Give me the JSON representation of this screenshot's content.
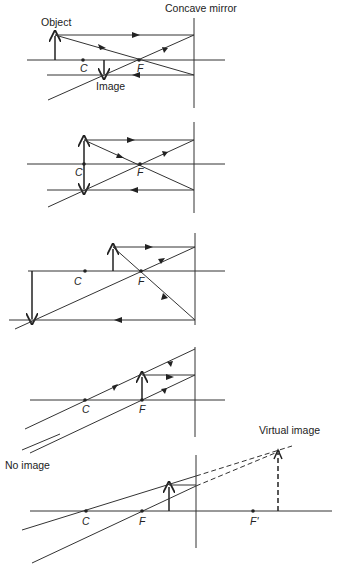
{
  "title": "Concave mirror",
  "diagrams": [
    {
      "id": "beyond-C",
      "labels": {
        "object": "Object",
        "image": "Image",
        "c": "C",
        "f": "F"
      }
    },
    {
      "id": "at-C",
      "labels": {
        "c": "C",
        "f": "F"
      }
    },
    {
      "id": "between-C-and-F",
      "labels": {
        "c": "C",
        "f": "F"
      }
    },
    {
      "id": "at-F",
      "labels": {
        "c": "C",
        "f": "F"
      }
    },
    {
      "id": "inside-F",
      "labels": {
        "c": "C",
        "f": "F",
        "f_prime": "F'",
        "no_image": "No image",
        "virtual_image": "Virtual  image"
      }
    }
  ]
}
